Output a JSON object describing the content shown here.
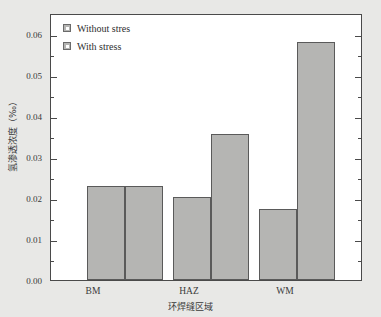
{
  "chart_data": {
    "type": "bar",
    "title": "",
    "subtitle": "",
    "xlabel": "环焊缝区域",
    "ylabel": "氢渗透浓度（‰）",
    "categories": [
      "BM",
      "HAZ",
      "WM"
    ],
    "series": [
      {
        "name": "Without stres",
        "values": [
          0.023,
          0.0205,
          0.0175
        ],
        "color": "#b5b5b3"
      },
      {
        "name": "With stress",
        "values": [
          0.023,
          0.036,
          0.0585
        ],
        "color": "#b5b5b3"
      }
    ],
    "ylim": [
      0.0,
      0.065
    ],
    "yticks": [
      0.0,
      0.01,
      0.02,
      0.03,
      0.04,
      0.05,
      0.06
    ],
    "ytick_labels": [
      "0.00",
      "0.01",
      "0.02",
      "0.03",
      "0.04",
      "0.05",
      "0.06"
    ],
    "yminor_ticks": [
      0.005,
      0.015,
      0.025,
      0.035,
      0.045,
      0.055
    ],
    "grid": false,
    "legend_position": "top-left",
    "bar_fill_color": "#b5b5b3",
    "bar_edge_color": "#5a5a5a",
    "axis_color": "#4a4a4a",
    "plot_background": "#ffffff",
    "figure_background": "#e8e8e6"
  },
  "legend": {
    "entries": [
      {
        "label": "Without stres"
      },
      {
        "label": "With stress"
      }
    ]
  },
  "axes": {
    "y_title": "氢渗透浓度（‰）",
    "x_title": "环焊缝区域",
    "y_tick_labels": [
      "0.06",
      "0.05",
      "0.04",
      "0.03",
      "0.02",
      "0.01",
      "0.00"
    ],
    "x_tick_labels": [
      "BM",
      "HAZ",
      "WM"
    ]
  }
}
